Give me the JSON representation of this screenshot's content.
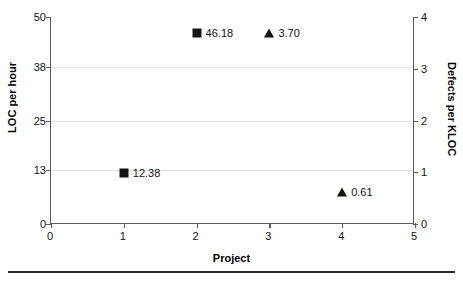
{
  "chart_data": {
    "type": "scatter",
    "title": "",
    "xlabel": "Project",
    "ylabel": "LOC per hour",
    "y2label": "Defects per KLOC",
    "xlim": [
      0,
      5
    ],
    "ylim": [
      0,
      50
    ],
    "y2lim": [
      0,
      4
    ],
    "xticks": [
      "0",
      "1",
      "2",
      "3",
      "4",
      "5"
    ],
    "yticks": [
      "0",
      "13",
      "25",
      "38",
      "50"
    ],
    "y2ticks": [
      "0",
      "1",
      "2",
      "3",
      "4"
    ],
    "grid": true,
    "legend": "none",
    "series": [
      {
        "name": "LOC per hour",
        "marker": "square",
        "axis": "left",
        "color": "#141414",
        "points": [
          {
            "x": 1,
            "y": 12.38,
            "label": "12.38"
          },
          {
            "x": 2,
            "y": 46.18,
            "label": "46.18"
          }
        ]
      },
      {
        "name": "Defects per KLOC",
        "marker": "triangle",
        "axis": "right",
        "color": "#141414",
        "points": [
          {
            "x": 3,
            "y": 3.7,
            "label": "3.70"
          },
          {
            "x": 4,
            "y": 0.61,
            "label": "0.61"
          }
        ]
      }
    ]
  },
  "axes": {
    "left": {
      "title": "LOC per hour",
      "ticks": [
        {
          "value": "0",
          "frac": 0.0
        },
        {
          "value": "13",
          "frac": 0.26
        },
        {
          "value": "25",
          "frac": 0.5
        },
        {
          "value": "38",
          "frac": 0.76
        },
        {
          "value": "50",
          "frac": 1.0
        }
      ]
    },
    "right": {
      "title": "Defects per KLOC",
      "ticks": [
        {
          "value": "0",
          "frac": 0.0
        },
        {
          "value": "1",
          "frac": 0.25
        },
        {
          "value": "2",
          "frac": 0.5
        },
        {
          "value": "3",
          "frac": 0.75
        },
        {
          "value": "4",
          "frac": 1.0
        }
      ]
    },
    "bottom": {
      "title": "Project",
      "ticks": [
        {
          "value": "0",
          "frac": 0.0
        },
        {
          "value": "1",
          "frac": 0.2
        },
        {
          "value": "2",
          "frac": 0.4
        },
        {
          "value": "3",
          "frac": 0.6
        },
        {
          "value": "4",
          "frac": 0.8
        },
        {
          "value": "5",
          "frac": 1.0
        }
      ]
    }
  },
  "colors": {
    "marker": "#141414",
    "grid": "#e2e2e2",
    "axis": "#5a5a5a",
    "rule": "#2b2b2b",
    "background": "#ffffff"
  }
}
